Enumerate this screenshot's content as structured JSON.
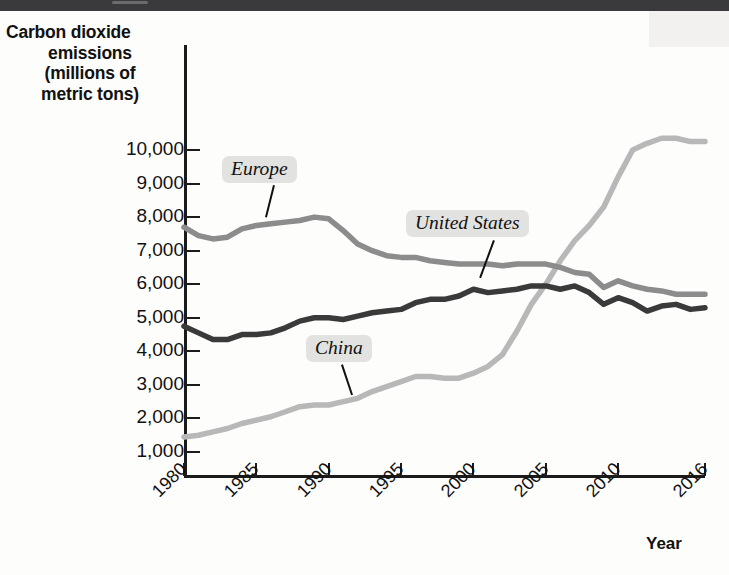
{
  "axis": {
    "y_title_lines": [
      "Carbon dioxide",
      "emissions",
      "(millions of",
      "metric tons)"
    ],
    "x_title": "Year",
    "y_ticks": [
      "10,000",
      "9,000",
      "8,000",
      "7,000",
      "6,000",
      "5,000",
      "4,000",
      "3,000",
      "2,000",
      "1,000"
    ],
    "x_ticks": [
      "1980",
      "1985",
      "1990",
      "1995",
      "2000",
      "2005",
      "2010",
      "2016"
    ]
  },
  "series_labels": [
    {
      "name": "europe-label",
      "text": "Europe"
    },
    {
      "name": "united-states-label",
      "text": "United States"
    },
    {
      "name": "china-label",
      "text": "China"
    }
  ],
  "colors": {
    "europe": "#8c8c8c",
    "united_states": "#3a3a3a",
    "china": "#b8b8b8",
    "axis": "#1b1b1b",
    "callout_bg": "#e2e2e0",
    "topbar": "#3a3a3c"
  },
  "chart_data": {
    "type": "line",
    "title": "",
    "xlabel": "Year",
    "ylabel": "Carbon dioxide emissions (millions of metric tons)",
    "xlim": [
      1980,
      2016
    ],
    "ylim": [
      0,
      10500
    ],
    "grid": false,
    "legend": "inline-callouts",
    "x": [
      1980,
      1981,
      1982,
      1983,
      1984,
      1985,
      1986,
      1987,
      1988,
      1989,
      1990,
      1991,
      1992,
      1993,
      1994,
      1995,
      1996,
      1997,
      1998,
      1999,
      2000,
      2001,
      2002,
      2003,
      2004,
      2005,
      2006,
      2007,
      2008,
      2009,
      2010,
      2011,
      2012,
      2013,
      2014,
      2015,
      2016
    ],
    "series": [
      {
        "name": "Europe",
        "color": "#8c8c8c",
        "values": [
          7700,
          7450,
          7350,
          7400,
          7650,
          7750,
          7800,
          7850,
          7900,
          8000,
          7950,
          7600,
          7200,
          7000,
          6850,
          6800,
          6800,
          6700,
          6650,
          6600,
          6600,
          6600,
          6550,
          6600,
          6600,
          6600,
          6500,
          6350,
          6300,
          5900,
          6100,
          5950,
          5850,
          5800,
          5700,
          5700,
          5700
        ]
      },
      {
        "name": "United States",
        "color": "#3a3a3a",
        "values": [
          4750,
          4550,
          4350,
          4350,
          4500,
          4500,
          4550,
          4700,
          4900,
          5000,
          5000,
          4950,
          5050,
          5150,
          5200,
          5250,
          5450,
          5550,
          5550,
          5650,
          5850,
          5750,
          5800,
          5850,
          5950,
          5950,
          5850,
          5950,
          5750,
          5400,
          5600,
          5450,
          5200,
          5350,
          5400,
          5250,
          5300
        ]
      },
      {
        "name": "China",
        "color": "#b8b8b8",
        "values": [
          1450,
          1500,
          1600,
          1700,
          1850,
          1950,
          2050,
          2200,
          2350,
          2400,
          2400,
          2500,
          2600,
          2800,
          2950,
          3100,
          3250,
          3250,
          3200,
          3200,
          3350,
          3550,
          3900,
          4600,
          5400,
          6000,
          6700,
          7300,
          7750,
          8300,
          9200,
          10000,
          10200,
          10350,
          10350,
          10250,
          10250
        ]
      }
    ]
  }
}
